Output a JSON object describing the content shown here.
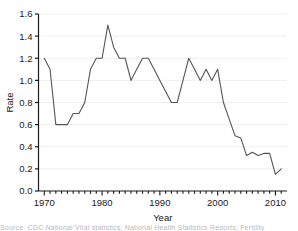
{
  "figure": {
    "background_color": "#ffffff",
    "line_color": "#555555",
    "grid_color": "#efefef",
    "axis_color": "#1a1a1a"
  },
  "caption": {
    "text": "Source: CDC National Vital statistics; National Health Statistics Reports; Fertility"
  },
  "chart_data": {
    "type": "line",
    "title": "",
    "xlabel": "Year",
    "ylabel": "Rate",
    "xlim": [
      1969,
      2012
    ],
    "ylim": [
      0.0,
      1.6
    ],
    "grid": true,
    "grid_axis": "y",
    "legend": false,
    "legend_position": "none",
    "xticks": [
      1970,
      1980,
      1990,
      2000,
      2010
    ],
    "xtick_labels": [
      "1970",
      "1980",
      "1990",
      "2000",
      "2010"
    ],
    "xminor_tick_step": 1,
    "yticks": [
      0.0,
      0.2,
      0.4,
      0.6,
      0.8,
      1.0,
      1.2,
      1.4,
      1.6
    ],
    "ytick_labels": [
      "0.0",
      "0.2",
      "0.4",
      "0.6",
      "0.8",
      "1.0",
      "1.2",
      "1.4",
      "1.6"
    ],
    "x": [
      1970,
      1971,
      1972,
      1973,
      1974,
      1975,
      1976,
      1977,
      1978,
      1979,
      1980,
      1981,
      1982,
      1983,
      1984,
      1985,
      1986,
      1987,
      1988,
      1989,
      1990,
      1991,
      1992,
      1993,
      1994,
      1995,
      1996,
      1997,
      1998,
      1999,
      2000,
      2001,
      2002,
      2003,
      2004,
      2005,
      2006,
      2007,
      2008,
      2009,
      2010,
      2011
    ],
    "values": [
      1.2,
      1.1,
      0.6,
      0.6,
      0.6,
      0.7,
      0.7,
      0.8,
      1.1,
      1.2,
      1.2,
      1.5,
      1.3,
      1.2,
      1.2,
      1.0,
      1.1,
      1.2,
      1.2,
      1.1,
      1.0,
      0.9,
      0.8,
      0.8,
      1.0,
      1.2,
      1.1,
      1.0,
      1.1,
      1.0,
      1.1,
      0.8,
      0.65,
      0.5,
      0.48,
      0.32,
      0.35,
      0.32,
      0.34,
      0.34,
      0.15,
      0.2
    ]
  }
}
